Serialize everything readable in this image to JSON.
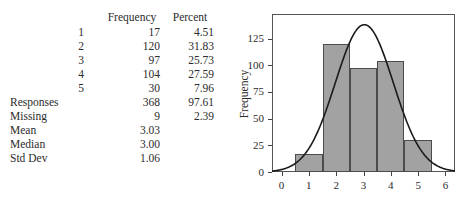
{
  "table": {
    "header": {
      "label": "",
      "index": "",
      "frequency": "Frequency",
      "percent": "Percent"
    },
    "rows": [
      {
        "label": "",
        "index": "1",
        "frequency": "17",
        "percent": "4.51"
      },
      {
        "label": "",
        "index": "2",
        "frequency": "120",
        "percent": "31.83"
      },
      {
        "label": "",
        "index": "3",
        "frequency": "97",
        "percent": "25.73"
      },
      {
        "label": "",
        "index": "4",
        "frequency": "104",
        "percent": "27.59"
      },
      {
        "label": "",
        "index": "5",
        "frequency": "30",
        "percent": "7.96"
      },
      {
        "label": "Responses",
        "index": "",
        "frequency": "368",
        "percent": "97.61"
      },
      {
        "label": "Missing",
        "index": "",
        "frequency": "9",
        "percent": "2.39"
      },
      {
        "label": "Mean",
        "index": "",
        "frequency": "3.03",
        "percent": ""
      },
      {
        "label": "Median",
        "index": "",
        "frequency": "3.00",
        "percent": ""
      },
      {
        "label": "Std Dev",
        "index": "",
        "frequency": "1.06",
        "percent": ""
      }
    ]
  },
  "chart_data": {
    "type": "bar",
    "title": "",
    "xlabel": "",
    "ylabel": "Frequency",
    "categories": [
      "1",
      "2",
      "3",
      "4",
      "5"
    ],
    "values": [
      17,
      120,
      97,
      104,
      30
    ],
    "bin_edges": [
      0.5,
      1.5,
      2.5,
      3.5,
      4.5,
      5.5
    ],
    "xlim": [
      -0.35,
      6.35
    ],
    "ylim": [
      0,
      148
    ],
    "xticks": [
      "0",
      "1",
      "2",
      "3",
      "4",
      "5",
      "6"
    ],
    "xtick_values": [
      0,
      1,
      2,
      3,
      4,
      5,
      6
    ],
    "yticks": [
      "0",
      "25",
      "50",
      "75",
      "100",
      "125"
    ],
    "ytick_values": [
      0,
      25,
      50,
      75,
      100,
      125
    ],
    "grid": false,
    "legend": false,
    "overlay": {
      "type": "line",
      "name": "normal-curve",
      "mean": 3.03,
      "std_dev": 1.06,
      "peak_value": 138,
      "n": 368,
      "bin_width": 1
    },
    "colors": {
      "bar_fill": "#a2a2a2",
      "bar_edge": "#4c4c4c",
      "curve": "#1a1a1a",
      "frame": "#555555",
      "background": "#ffffff"
    }
  }
}
